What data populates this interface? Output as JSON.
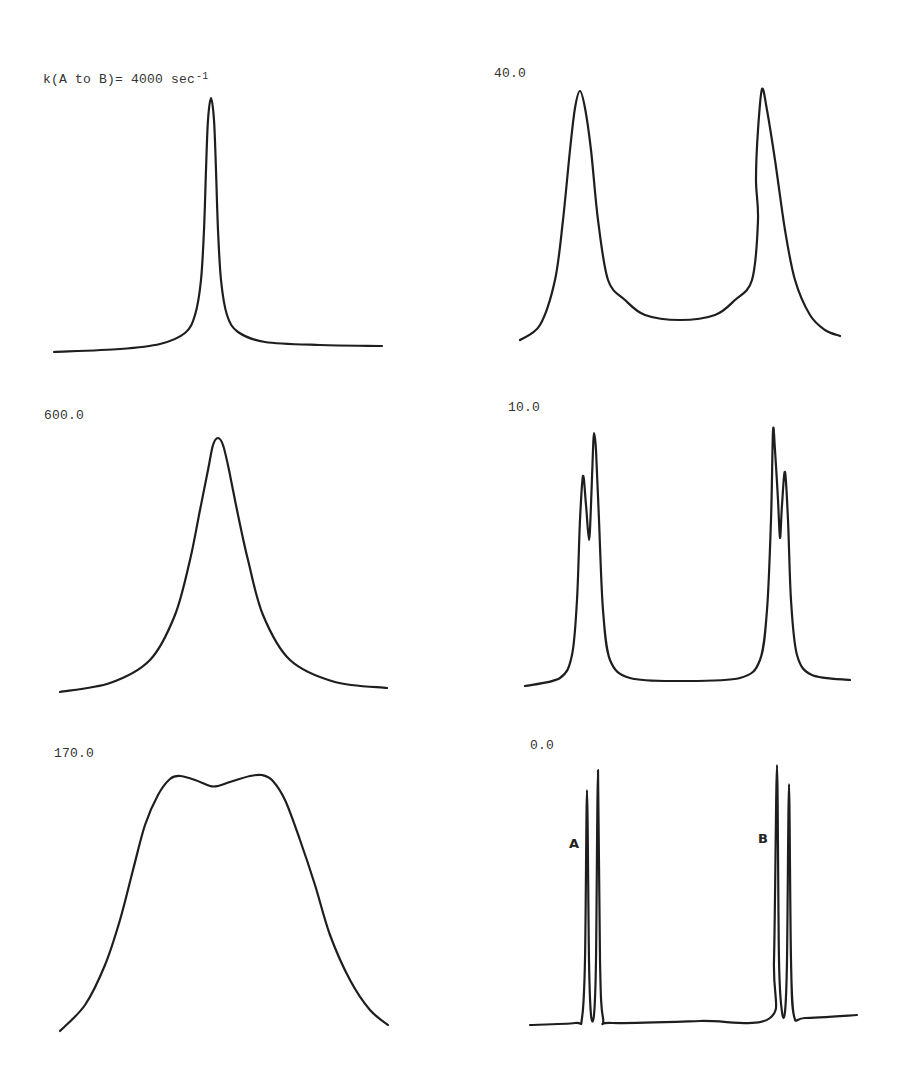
{
  "figure": {
    "rate_unit": "sec",
    "rate_unit_exponent": "-1"
  },
  "panels": [
    {
      "id": "p1",
      "label": "k(A to B)= 4000",
      "unit": " sec",
      "exp": "-1",
      "k": 4000.0
    },
    {
      "id": "p2",
      "label": "40.0",
      "k": 40.0
    },
    {
      "id": "p3",
      "label": "600.0",
      "k": 600.0
    },
    {
      "id": "p4",
      "label": "10.0",
      "k": 10.0
    },
    {
      "id": "p5",
      "label": "170.0",
      "k": 170.0
    },
    {
      "id": "p6",
      "label": "0.0",
      "k": 0.0,
      "peak_labels": [
        "A",
        "B"
      ]
    }
  ],
  "chart_data": [
    {
      "type": "line",
      "title": "k(A to B)= 4000 sec^-1",
      "xlabel": "",
      "ylabel": "",
      "description": "Fast exchange: single sharp coalesced line at center",
      "grid": false,
      "points": [
        [
          54,
          352
        ],
        [
          120,
          349
        ],
        [
          160,
          344
        ],
        [
          185,
          333
        ],
        [
          195,
          315
        ],
        [
          201,
          280
        ],
        [
          204,
          230
        ],
        [
          206,
          170
        ],
        [
          208,
          120
        ],
        [
          211,
          98
        ],
        [
          214,
          120
        ],
        [
          216,
          170
        ],
        [
          218,
          230
        ],
        [
          221,
          280
        ],
        [
          227,
          315
        ],
        [
          238,
          332
        ],
        [
          265,
          342
        ],
        [
          320,
          345
        ],
        [
          382,
          346
        ]
      ]
    },
    {
      "type": "line",
      "title": "40.0",
      "xlabel": "",
      "ylabel": "",
      "description": "Slow exchange: two broadened separated lines",
      "grid": false,
      "points": [
        [
          520,
          340
        ],
        [
          540,
          325
        ],
        [
          555,
          280
        ],
        [
          563,
          220
        ],
        [
          570,
          150
        ],
        [
          575,
          108
        ],
        [
          580,
          91
        ],
        [
          585,
          108
        ],
        [
          591,
          150
        ],
        [
          598,
          220
        ],
        [
          608,
          280
        ],
        [
          625,
          300
        ],
        [
          645,
          315
        ],
        [
          680,
          320
        ],
        [
          715,
          315
        ],
        [
          735,
          300
        ],
        [
          752,
          280
        ],
        [
          758,
          220
        ],
        [
          756,
          180
        ],
        [
          758,
          130
        ],
        [
          762,
          89
        ],
        [
          767,
          110
        ],
        [
          775,
          160
        ],
        [
          785,
          230
        ],
        [
          795,
          280
        ],
        [
          810,
          315
        ],
        [
          825,
          330
        ],
        [
          840,
          336
        ]
      ]
    },
    {
      "type": "line",
      "title": "600.0",
      "xlabel": "",
      "ylabel": "",
      "description": "Intermediate-fast exchange: single broadened coalesced line",
      "grid": false,
      "points": [
        [
          60,
          692
        ],
        [
          110,
          683
        ],
        [
          150,
          660
        ],
        [
          175,
          615
        ],
        [
          190,
          560
        ],
        [
          200,
          510
        ],
        [
          208,
          470
        ],
        [
          213,
          445
        ],
        [
          218,
          438
        ],
        [
          223,
          445
        ],
        [
          229,
          470
        ],
        [
          237,
          510
        ],
        [
          248,
          560
        ],
        [
          263,
          615
        ],
        [
          290,
          660
        ],
        [
          335,
          682
        ],
        [
          387,
          688
        ]
      ]
    },
    {
      "type": "line",
      "title": "10.0",
      "xlabel": "",
      "ylabel": "",
      "description": "Slow exchange: two doublets with slight broadening",
      "grid": false,
      "points": [
        [
          525,
          686
        ],
        [
          560,
          678
        ],
        [
          572,
          655
        ],
        [
          577,
          600
        ],
        [
          580,
          520
        ],
        [
          583,
          476
        ],
        [
          586,
          505
        ],
        [
          589,
          540
        ],
        [
          591,
          505
        ],
        [
          593,
          450
        ],
        [
          594,
          433
        ],
        [
          596,
          450
        ],
        [
          599,
          520
        ],
        [
          603,
          610
        ],
        [
          610,
          660
        ],
        [
          630,
          678
        ],
        [
          680,
          681
        ],
        [
          740,
          678
        ],
        [
          760,
          660
        ],
        [
          767,
          610
        ],
        [
          771,
          520
        ],
        [
          773,
          431
        ],
        [
          775,
          450
        ],
        [
          778,
          500
        ],
        [
          780,
          538
        ],
        [
          782,
          505
        ],
        [
          785,
          472
        ],
        [
          788,
          520
        ],
        [
          791,
          600
        ],
        [
          797,
          655
        ],
        [
          812,
          675
        ],
        [
          850,
          680
        ]
      ]
    },
    {
      "type": "line",
      "title": "170.0",
      "xlabel": "",
      "ylabel": "",
      "description": "Near coalescence: flat-topped broad band with shallow central dip",
      "grid": false,
      "points": [
        [
          60,
          1031
        ],
        [
          85,
          1005
        ],
        [
          105,
          965
        ],
        [
          120,
          920
        ],
        [
          133,
          870
        ],
        [
          145,
          825
        ],
        [
          158,
          795
        ],
        [
          170,
          779
        ],
        [
          180,
          776
        ],
        [
          195,
          780
        ],
        [
          210,
          786
        ],
        [
          218,
          786
        ],
        [
          230,
          782
        ],
        [
          250,
          776
        ],
        [
          262,
          775
        ],
        [
          272,
          780
        ],
        [
          285,
          800
        ],
        [
          300,
          840
        ],
        [
          315,
          885
        ],
        [
          330,
          935
        ],
        [
          350,
          980
        ],
        [
          370,
          1010
        ],
        [
          388,
          1025
        ]
      ]
    },
    {
      "type": "line",
      "title": "0.0",
      "xlabel": "",
      "ylabel": "",
      "description": "No exchange: sharp lines for A and B sites, each split into a doublet",
      "grid": false,
      "annotations": [
        {
          "text": "A",
          "x": 574,
          "y": 845
        },
        {
          "text": "B",
          "x": 763,
          "y": 840
        }
      ],
      "points": [
        [
          530,
          1025
        ],
        [
          575,
          1023
        ],
        [
          582,
          1018
        ],
        [
          585,
          960
        ],
        [
          587,
          790
        ],
        [
          589,
          960
        ],
        [
          591,
          1015
        ],
        [
          594,
          1015
        ],
        [
          596,
          960
        ],
        [
          598,
          770
        ],
        [
          600,
          960
        ],
        [
          603,
          1018
        ],
        [
          612,
          1023
        ],
        [
          700,
          1021
        ],
        [
          770,
          1018
        ],
        [
          774,
          960
        ],
        [
          777,
          765
        ],
        [
          779,
          960
        ],
        [
          782,
          1012
        ],
        [
          785,
          1012
        ],
        [
          787,
          960
        ],
        [
          789,
          784
        ],
        [
          791,
          960
        ],
        [
          794,
          1016
        ],
        [
          805,
          1018
        ],
        [
          857,
          1015
        ]
      ]
    }
  ]
}
